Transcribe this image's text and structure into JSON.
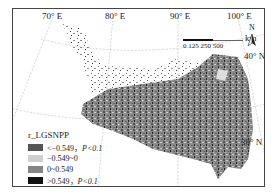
{
  "map": {
    "graticule_labels": {
      "lon": [
        "70° E",
        "80° E",
        "90° E",
        "100° E"
      ],
      "lat": [
        "40° N",
        "30° N"
      ]
    },
    "scale_bar": {
      "ticks": "0 125 250      500",
      "unit": "km"
    },
    "north_arrow": {
      "label": "N",
      "icon": "north-arrow-icon"
    },
    "legend": {
      "title": "r_LGSNPP",
      "items": [
        {
          "label": "<−0.549，",
          "p": "P<0.1",
          "color": "#555555"
        },
        {
          "label": "−0.549~0",
          "p": "",
          "color": "#cfcfcf"
        },
        {
          "label": "0~0.549",
          "p": "",
          "color": "#858585"
        },
        {
          "label": ">0.549，",
          "p": "P<0.1",
          "color": "#111111"
        }
      ]
    }
  }
}
